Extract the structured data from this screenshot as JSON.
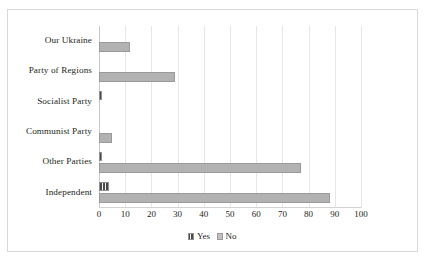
{
  "chart_data": {
    "type": "bar",
    "orientation": "horizontal",
    "title": "",
    "xlabel": "",
    "ylabel": "",
    "xlim": [
      0,
      100
    ],
    "xticks": [
      0,
      10,
      20,
      30,
      40,
      50,
      60,
      70,
      80,
      90,
      100
    ],
    "grid": true,
    "legend_position": "bottom-center",
    "categories": [
      "Our Ukraine",
      "Party of Regions",
      "Socialist Party",
      "Communist Party",
      "Other Parties",
      "Independent"
    ],
    "series": [
      {
        "name": "Yes",
        "color": "#6d6d6d",
        "pattern": "vertical-hatch",
        "values": [
          0,
          0,
          1,
          0,
          1,
          4
        ]
      },
      {
        "name": "No",
        "color": "#b2b2b2",
        "pattern": "solid",
        "values": [
          12,
          29,
          0,
          5,
          77,
          88
        ]
      }
    ]
  },
  "legend": {
    "items": [
      {
        "label": "Yes",
        "icon": "legend-swatch-hatched"
      },
      {
        "label": "No",
        "icon": "legend-swatch-solid"
      }
    ]
  },
  "caption": {
    "text": ""
  }
}
